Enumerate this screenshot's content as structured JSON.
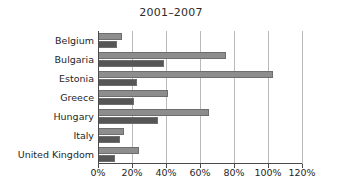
{
  "chart_data": {
    "type": "bar",
    "orientation": "horizontal",
    "title": "2001–2007",
    "xlabel": "",
    "ylabel": "",
    "xlim": [
      0,
      120
    ],
    "xticks": [
      0,
      20,
      40,
      60,
      80,
      100,
      120
    ],
    "xtick_labels": [
      "0%",
      "20%",
      "40%",
      "60%",
      "80%",
      "100%",
      "120%"
    ],
    "grid": true,
    "legend": "none",
    "categories": [
      "Belgium",
      "Bulgaria",
      "Estonia",
      "Greece",
      "Hungary",
      "Italy",
      "United Kingdom"
    ],
    "series": [
      {
        "name": "series-a",
        "color": "#8d8d8d",
        "values": [
          14,
          75,
          103,
          41,
          65,
          15,
          24
        ]
      },
      {
        "name": "series-b",
        "color": "#565656",
        "values": [
          11,
          39,
          23,
          21,
          35,
          13,
          10
        ]
      }
    ]
  },
  "colors": {
    "series_a": "#8d8d8d",
    "series_b": "#565656",
    "grid": "#b9b9b9",
    "axis": "#4a4a4a",
    "background": "#ffffff",
    "text": "#1f1f1f"
  }
}
